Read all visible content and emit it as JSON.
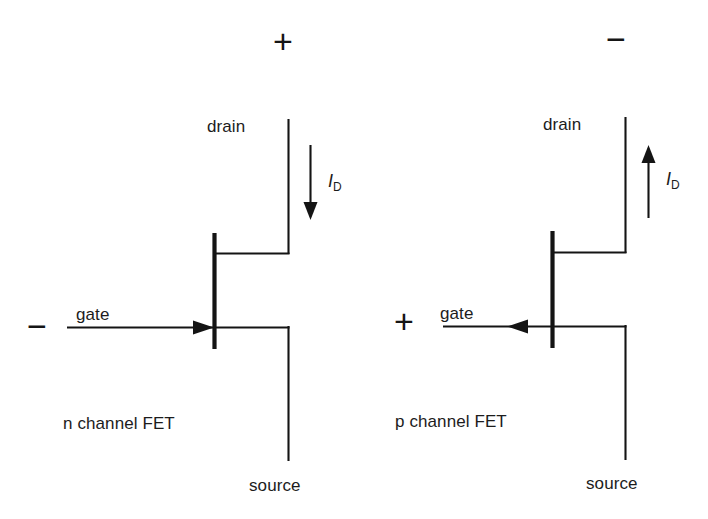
{
  "figure": {
    "background_color": "#ffffff",
    "line_color": "#141414",
    "text_color": "#1c1c1c"
  },
  "left_device": {
    "name": "n-channel-fet",
    "caption": "n channel FET",
    "drain_label": "drain",
    "gate_label": "gate",
    "source_label": "source",
    "current_symbol": "I",
    "current_subscript": "D",
    "supply_sign": "+",
    "gate_sign": "−",
    "current_direction": "down",
    "gate_arrow_direction": "right"
  },
  "right_device": {
    "name": "p-channel-fet",
    "caption": "p channel FET",
    "drain_label": "drain",
    "gate_label": "gate",
    "source_label": "source",
    "current_symbol": "I",
    "current_subscript": "D",
    "supply_sign": "−",
    "gate_sign": "+",
    "current_direction": "up",
    "gate_arrow_direction": "left"
  }
}
